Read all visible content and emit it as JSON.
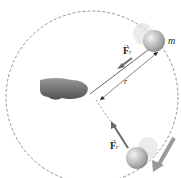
{
  "diagram": {
    "labels": {
      "mass": "m",
      "radius": "r",
      "force_top": {
        "symbol": "F",
        "subscript": "r",
        "arrow": "→"
      },
      "force_bottom": {
        "symbol": "F",
        "subscript": "r",
        "arrow": "→"
      }
    },
    "colors": {
      "circle": "#777777",
      "string": "#666666",
      "force_arrow": "#6a6a6a",
      "ball": "#b8b8b8",
      "velocity_arrow": "#9a9a9a",
      "hand": "#6e6e6e"
    }
  }
}
